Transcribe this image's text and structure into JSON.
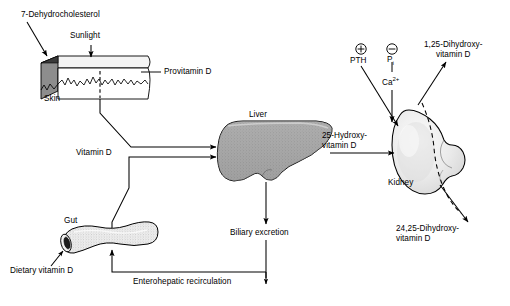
{
  "diagram": {
    "background_color": "#ffffff",
    "stroke_color": "#000000",
    "organ_fill_liver": "#9e9e9e",
    "organ_fill_kidney": "#ececec",
    "organ_fill_gut": "#e4e4e4",
    "skin_top_fill": "#f2f2f2",
    "skin_side_fill": "#8f8f8f",
    "skin_front_fill": "#ffffff"
  },
  "labels": {
    "dehydrocholesterol": "7-Dehydrocholesterol",
    "sunlight": "Sunlight",
    "provitamin_d": "Provitamin D",
    "skin": "Skin",
    "vitamin_d": "Vitamin D",
    "gut": "Gut",
    "dietary_vitamin_d": "Dietary vitamin D",
    "liver": "Liver",
    "biliary_excretion": "Biliary excretion",
    "enterohepatic_recirculation": "Enterohepatic recirculation",
    "hydroxy_25_line1": "25-Hydroxy-",
    "hydroxy_25_line2": "vitamin D",
    "kidney": "Kidney",
    "pth": "PTH",
    "pth_sign": "⊕",
    "pi": "P",
    "pi_subscript": "i",
    "pi_sign": "⊖",
    "calcium": "Ca",
    "calcium_superscript": "2+",
    "dihydroxy_125_line1": "1,25-Dihydroxy-",
    "dihydroxy_125_line2": "vitamin D",
    "dihydroxy_2425_line1": "24,25-Dihydroxy-",
    "dihydroxy_2425_line2": "vitamin D"
  },
  "nodes": [
    {
      "id": "skin",
      "name": "Skin",
      "type": "organ"
    },
    {
      "id": "gut",
      "name": "Gut",
      "type": "organ"
    },
    {
      "id": "liver",
      "name": "Liver",
      "type": "organ"
    },
    {
      "id": "kidney",
      "name": "Kidney",
      "type": "organ"
    }
  ],
  "flows": [
    {
      "from": "7-Dehydrocholesterol",
      "to": "Skin",
      "style": "solid"
    },
    {
      "from": "Sunlight",
      "to": "Skin",
      "style": "solid"
    },
    {
      "from": "Skin",
      "to": "Liver",
      "label": "Vitamin D",
      "style": "solid"
    },
    {
      "from": "Dietary vitamin D",
      "to": "Gut",
      "style": "solid"
    },
    {
      "from": "Gut",
      "to": "Liver",
      "label": "Vitamin D",
      "style": "solid"
    },
    {
      "from": "Liver",
      "to": "Kidney",
      "label": "25-Hydroxyvitamin D",
      "style": "solid"
    },
    {
      "from": "Liver",
      "to": "Biliary excretion",
      "style": "solid"
    },
    {
      "from": "Biliary excretion",
      "to": "Gut",
      "label": "Enterohepatic recirculation",
      "style": "solid"
    },
    {
      "from": "PTH",
      "to": "Kidney",
      "effect": "stimulatory",
      "style": "solid"
    },
    {
      "from": "Ca2+",
      "to": "Kidney",
      "effect": "inhibitory",
      "style": "solid"
    },
    {
      "from": "Kidney",
      "to": "1,25-Dihydroxyvitamin D",
      "style": "solid"
    },
    {
      "from": "Kidney",
      "to": "24,25-Dihydroxyvitamin D",
      "style": "solid"
    }
  ]
}
